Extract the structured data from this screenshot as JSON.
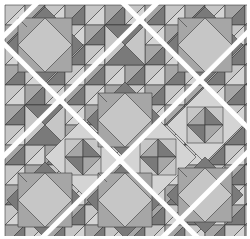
{
  "image": {
    "description": "Quilt pattern of square-in-square and hourglass star blocks with white diagonal sashing",
    "width": 250,
    "height": 239
  },
  "colors": {
    "background": "#ffffff",
    "dark": "#7a7a7a",
    "medium": "#a6a6a6",
    "light": "#c6c6c6",
    "pale": "#d4d4d4",
    "outline": "#3a3a3a",
    "sashing": "#ffffff"
  },
  "grid": {
    "cell": 40,
    "origin_x": 5,
    "origin_y": 5,
    "cols": 6,
    "rows": 6
  },
  "blocks": [
    {
      "type": "square-in-square",
      "cx": 45,
      "cy": 45
    },
    {
      "type": "hourglass",
      "cx": 125,
      "cy": 45
    },
    {
      "type": "square-in-square",
      "cx": 205,
      "cy": 45
    },
    {
      "type": "hourglass",
      "cx": 45,
      "cy": 125
    },
    {
      "type": "star",
      "cx": 83,
      "cy": 157
    },
    {
      "type": "square-in-square",
      "cx": 125,
      "cy": 120
    },
    {
      "type": "star",
      "cx": 158,
      "cy": 157
    },
    {
      "type": "star",
      "cx": 205,
      "cy": 125
    },
    {
      "type": "square-in-square",
      "cx": 45,
      "cy": 200
    },
    {
      "type": "square-in-square",
      "cx": 125,
      "cy": 200
    },
    {
      "type": "square-in-square",
      "cx": 205,
      "cy": 195
    }
  ],
  "sashing": {
    "width": 5,
    "diagonals_down": [
      -40,
      120
    ],
    "diagonals_up": [
      40,
      160,
      280,
      400
    ]
  }
}
